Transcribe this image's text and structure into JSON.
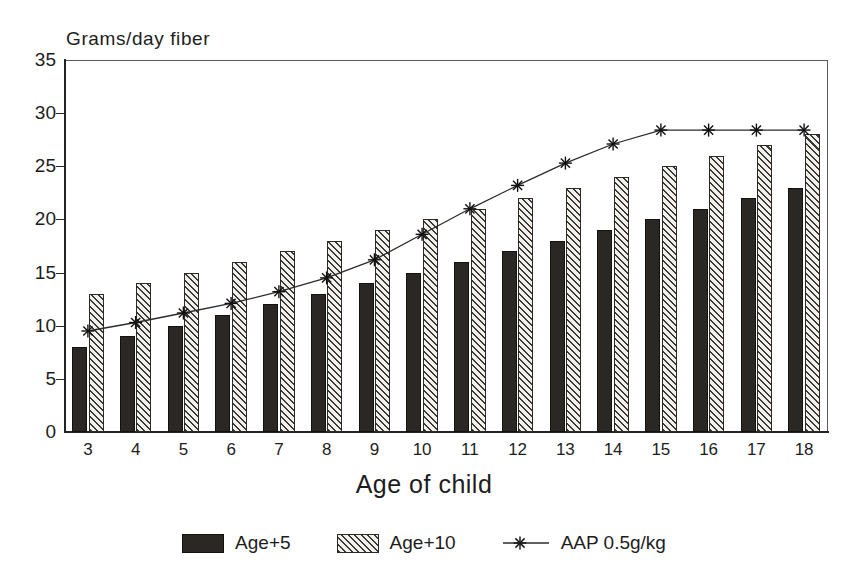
{
  "chart_data": {
    "type": "bar",
    "title": "",
    "ylabel": "Grams/day fiber",
    "xlabel": "Age of child",
    "categories": [
      "3",
      "4",
      "5",
      "6",
      "7",
      "8",
      "9",
      "10",
      "11",
      "12",
      "13",
      "14",
      "15",
      "16",
      "17",
      "18"
    ],
    "ylim": [
      0,
      35
    ],
    "yticks": [
      "0",
      "5",
      "10",
      "15",
      "20",
      "25",
      "30",
      "35"
    ],
    "grid": false,
    "legend_position": "bottom",
    "series": [
      {
        "name": "Age+5",
        "style": "bar-solid",
        "values": [
          8,
          9,
          10,
          11,
          12,
          13,
          14,
          15,
          16,
          17,
          18,
          19,
          20,
          21,
          22,
          23
        ]
      },
      {
        "name": "Age+10",
        "style": "bar-hatched",
        "values": [
          13,
          14,
          15,
          16,
          17,
          18,
          19,
          20,
          21,
          22,
          23,
          24,
          25,
          26,
          27,
          28
        ]
      },
      {
        "name": "AAP 0.5g/kg",
        "style": "line-asterisk",
        "values": [
          9.5,
          10.3,
          11.2,
          12.1,
          13.2,
          14.5,
          16.2,
          18.6,
          21.0,
          23.2,
          25.3,
          27.1,
          28.4,
          28.4,
          28.4,
          28.4
        ]
      }
    ]
  },
  "legend": {
    "items": [
      {
        "label": "Age+5",
        "marker": "solid-swatch"
      },
      {
        "label": "Age+10",
        "marker": "hatched-swatch"
      },
      {
        "label": "AAP 0.5g/kg",
        "marker": "asterisk-line"
      }
    ]
  }
}
